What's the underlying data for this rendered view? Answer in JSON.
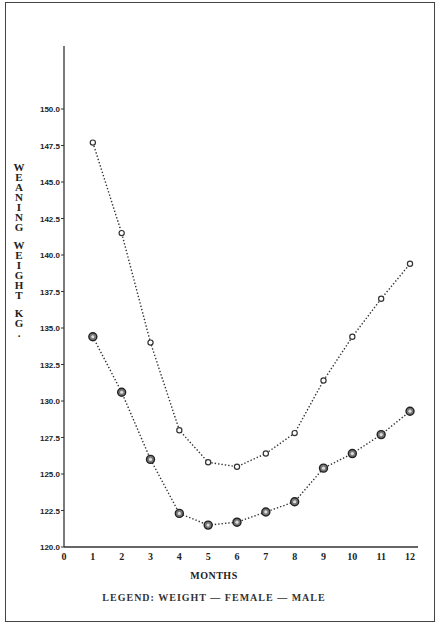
{
  "chart_data": {
    "type": "line",
    "title": "",
    "xlabel": "MONTHS",
    "ylabel": "WEANING WEIGHT KG.",
    "x": [
      1,
      2,
      3,
      4,
      5,
      6,
      7,
      8,
      9,
      10,
      11,
      12
    ],
    "x_ticks": [
      "0",
      "1",
      "2",
      "3",
      "4",
      "5",
      "6",
      "7",
      "8",
      "9",
      "10",
      "11",
      "12"
    ],
    "y_ticks": [
      "120.0",
      "122.5",
      "125.0",
      "127.5",
      "130.0",
      "132.5",
      "135.0",
      "137.5",
      "140.0",
      "142.5",
      "145.0",
      "147.5",
      "150.0"
    ],
    "xlim": [
      0,
      12
    ],
    "ylim": [
      120.0,
      150.0
    ],
    "grid": false,
    "legend_position": "bottom (cut off)",
    "legend_text": "LEGEND: WEIGHT ... FEMALE ... MALE",
    "series": [
      {
        "name": "upper series (open circles)",
        "marker": "open-circle",
        "line": "dotted",
        "values": [
          147.7,
          141.5,
          134.0,
          128.0,
          125.8,
          125.5,
          126.4,
          127.8,
          131.4,
          134.4,
          137.0,
          139.4
        ]
      },
      {
        "name": "lower series (filled circles)",
        "marker": "filled-circle",
        "line": "dotted",
        "values": [
          134.4,
          130.6,
          126.0,
          122.3,
          121.5,
          121.7,
          122.4,
          123.1,
          125.4,
          126.4,
          127.7,
          129.3
        ]
      }
    ]
  },
  "labels": {
    "ylabel_letters_1": [
      "W",
      "E",
      "A",
      "N",
      "I",
      "N",
      "G"
    ],
    "ylabel_letters_2": [
      "W",
      "E",
      "I",
      "G",
      "H",
      "T"
    ],
    "ylabel_letters_3": [
      "K",
      "G",
      "."
    ],
    "xlabel": "MONTHS",
    "legend": "LEGEND: WEIGHT — FEMALE — MALE"
  }
}
